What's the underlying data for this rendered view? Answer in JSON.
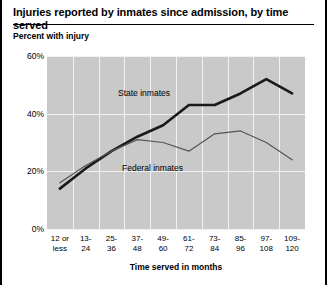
{
  "figure": {
    "title": "Injuries reported by inmates since admission, by time served",
    "y_axis_note": "Percent with injury",
    "x_axis_title": "Time served in months"
  },
  "chart_data": {
    "type": "line",
    "title": "Injuries reported by inmates since admission, by time served",
    "xlabel": "Time served in months",
    "ylabel": "Percent with injury",
    "ylim": [
      0,
      60
    ],
    "yticks": [
      "0%",
      "20%",
      "40%",
      "60%"
    ],
    "ytick_values": [
      0,
      20,
      40,
      60
    ],
    "grid": true,
    "legend": "inline-annotations",
    "categories": [
      "12 or less",
      "13-24",
      "25-36",
      "37-48",
      "49-60",
      "61-72",
      "73-84",
      "85-96",
      "97-108",
      "109-120"
    ],
    "series": [
      {
        "name": "State inmates",
        "values": [
          14,
          21,
          27,
          32,
          36,
          43,
          43,
          47,
          52,
          47
        ]
      },
      {
        "name": "Federal inmates",
        "values": [
          16,
          22,
          27,
          31,
          30,
          27,
          33,
          34,
          30,
          24
        ]
      }
    ]
  },
  "colors": {
    "plot_background": "#c9c9c9",
    "gridline": "#f2f2f2",
    "state_line": "#1a1a1a",
    "federal_line": "#555555",
    "text": "#000000"
  }
}
